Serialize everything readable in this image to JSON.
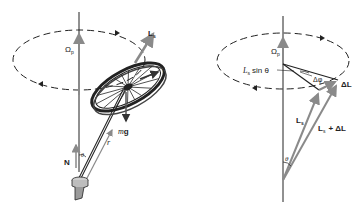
{
  "figure": {
    "left_panel": {
      "labels": {
        "omega_p": "Ω",
        "omega_p_sub": "p",
        "L_s": "L",
        "L_s_sub": "s",
        "tau": "τ",
        "mg_m": "m",
        "mg_g": "g",
        "r": "r",
        "N": "N",
        "theta": "θ"
      }
    },
    "right_panel": {
      "labels": {
        "omega_p": "Ω",
        "omega_p_sub": "p",
        "Ls_sin_theta_L": "L",
        "Ls_sin_theta_sub": "s",
        "Ls_sin_theta_rest": "sin θ",
        "delta_phi": "Δφ",
        "delta_L": "ΔL",
        "L_s": "L",
        "L_s_sub": "s",
        "Ls_plus_dL_L": "L",
        "Ls_plus_dL_sub": "s",
        "Ls_plus_dL_rest": "+ ΔL",
        "theta": "θ"
      }
    },
    "colors": {
      "ink": "#222222",
      "vector_gray": "#8a8a8a",
      "background": "#ffffff"
    }
  }
}
